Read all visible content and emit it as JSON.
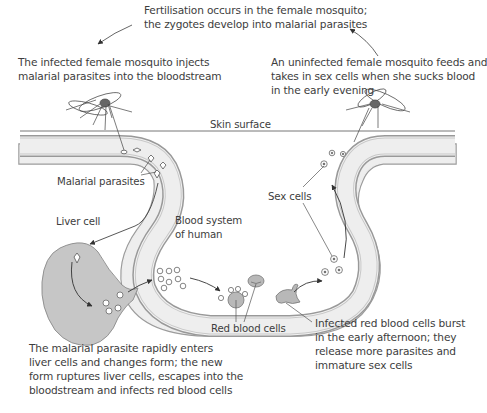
{
  "labels": {
    "fertilisation": [
      "Fertilisation occurs in the female mosquito;",
      "the zygotes develop into malarial parasites"
    ],
    "injects": [
      "The infected female mosquito injects",
      "malarial parasites into the bloodstream"
    ],
    "uninfected": [
      "An uninfected female mosquito feeds and",
      "takes in sex cells when she sucks blood",
      "in the early evening"
    ],
    "skin_surface": "Skin surface",
    "malarial_parasites": "Malarial parasites",
    "sex_cells": "Sex cells",
    "liver_cell": "Liver cell",
    "blood_system": [
      "Blood system",
      "of human"
    ],
    "red_blood_cells": "Red blood cells",
    "liver_stage": [
      "The malarial parasite rapidly enters",
      "liver cells and changes form; the new",
      "form ruptures liver cells, escapes into the",
      "bloodstream and infects red blood cells"
    ],
    "burst": [
      "Infected red blood cells burst",
      "in the early afternoon; they",
      "release more parasites and",
      "immature sex cells"
    ]
  },
  "colors": {
    "vessel_fill": "#eeeeee",
    "vessel_wall": "#b5b5b5",
    "line": "#555555",
    "liver_fill": "#c6c6c6",
    "cell_fill": "#b8b8b8",
    "text": "#3d3d3d"
  }
}
